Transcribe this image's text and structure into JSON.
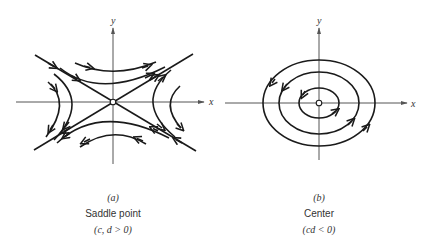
{
  "panels": [
    {
      "id": "a",
      "label": "(a)",
      "title": "Saddle point",
      "condition": "(c, d > 0)",
      "x_axis_label": "x",
      "y_axis_label": "y",
      "trajectory_type": "hyperbolic",
      "origin_marker": "open-circle"
    },
    {
      "id": "b",
      "label": "(b)",
      "title": "Center",
      "condition": "(cd < 0)",
      "x_axis_label": "x",
      "y_axis_label": "y",
      "trajectory_type": "closed-ellipses",
      "ellipse_count": 3,
      "origin_marker": "open-circle"
    }
  ],
  "colors": {
    "line": "#1a1a1a",
    "axis": "#555555",
    "text": "#333333"
  }
}
